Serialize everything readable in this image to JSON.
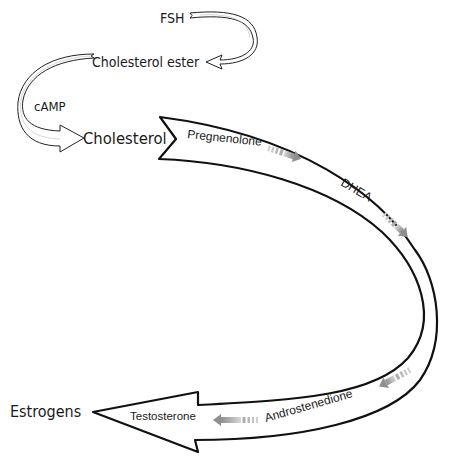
{
  "diagram": {
    "type": "steroidogenesis pathway",
    "nodes": {
      "fsh": "FSH",
      "cholesterol_ester": "Cholesterol ester",
      "camp": "cAMP",
      "cholesterol": "Cholesterol",
      "pregnenolone": "Pregnenolone",
      "dhea": "DHEA",
      "androstenedione": "Androstenedione",
      "testosterone": "Testosterone",
      "estrogens": "Estrogens"
    },
    "flow": [
      "FSH",
      "Cholesterol ester",
      "Cholesterol",
      "Pregnenolone",
      "DHEA",
      "Androstenedione",
      "Testosterone",
      "Estrogens"
    ],
    "colors": {
      "outline": "#111111",
      "fill": "#ffffff",
      "step_arrow": "#9a9a9a",
      "text": "#1a1a1a"
    }
  }
}
